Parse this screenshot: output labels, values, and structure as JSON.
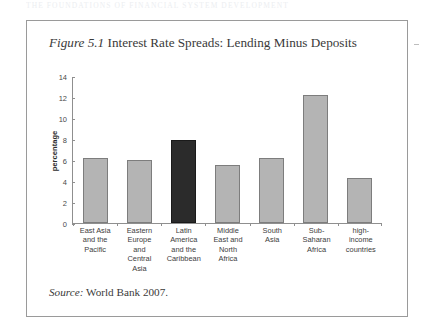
{
  "page_header": "THE FOUNDATIONS OF FINANCIAL SYSTEM DEVELOPMENT",
  "figure": {
    "number_label": "Figure 5.1",
    "title": "Interest Rate Spreads: Lending Minus Deposits",
    "source_word": "Source:",
    "source_text": "World Bank 2007."
  },
  "colors": {
    "bar_fill": "#b4b4b4",
    "bar_stroke": "#7d7d7d",
    "highlight_fill": "#2b2b2b",
    "axis": "#8f8f8f",
    "frame": "#9a9a9a"
  },
  "chart_data": {
    "type": "bar",
    "title": "Interest Rate Spreads: Lending Minus Deposits",
    "xlabel": "",
    "ylabel": "percentage",
    "ylim": [
      0,
      14
    ],
    "yticks": [
      0,
      2,
      4,
      6,
      8,
      10,
      12,
      14
    ],
    "grid": false,
    "legend": "none",
    "highlight_index": 2,
    "categories": [
      "East Asia and the Pacific",
      "Eastern Europe and Central Asia",
      "Latin America and the Caribbean",
      "Middle East and North Africa",
      "South Asia",
      "Sub-Saharan Africa",
      "high-income countries"
    ],
    "category_lines": [
      [
        "East Asia",
        "and the",
        "Pacific"
      ],
      [
        "Eastern",
        "Europe",
        "and",
        "Central",
        "Asia"
      ],
      [
        "Latin",
        "America",
        "and the",
        "Caribbean"
      ],
      [
        "Middle",
        "East and",
        "North",
        "Africa"
      ],
      [
        "South",
        "Asia"
      ],
      [
        "Sub-",
        "Saharan",
        "Africa"
      ],
      [
        "high-",
        "income",
        "countries"
      ]
    ],
    "values": [
      6.2,
      6.0,
      8.0,
      5.6,
      6.2,
      12.3,
      4.3
    ]
  }
}
